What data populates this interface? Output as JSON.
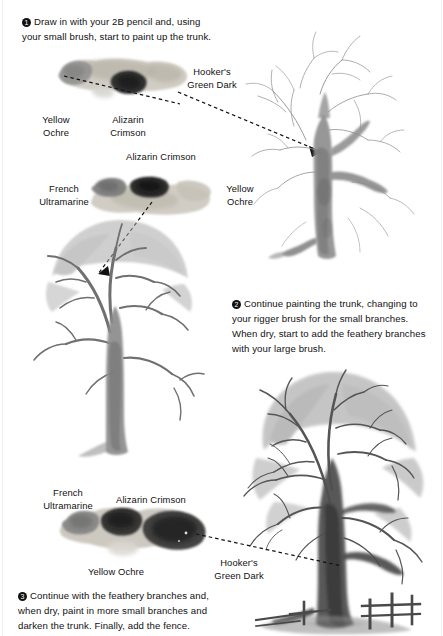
{
  "page": {
    "background": "#ffffff",
    "width": 443,
    "height": 636
  },
  "steps": [
    {
      "number": "❶",
      "number_plain": "1",
      "text": "Draw in with your 2B pencil and, using your small brush, start to paint up the trunk."
    },
    {
      "number": "❷",
      "number_plain": "2",
      "text": "Continue painting the trunk, changing to your rigger brush for the small branches. When dry, start to add the feathery branches with your large brush."
    },
    {
      "number": "❸",
      "number_plain": "3",
      "text": "Continue with the feathery branches and, when dry, paint in more small branches and darken the trunk. Finally, add the fence."
    }
  ],
  "pigment_labels": {
    "hookers_green_dark_top": "Hooker's\nGreen Dark",
    "yellow_ochre_top": "Yellow\nOchre",
    "alizarin_crimson_top": "Alizarin\nCrimson",
    "alizarin_crimson_mid": "Alizarin Crimson",
    "french_ultramarine_mid": "French\nUltramarine",
    "yellow_ochre_mid": "Yellow\nOchre",
    "french_ultramarine_bottom": "French\nUltramarine",
    "alizarin_crimson_bottom": "Alizarin Crimson",
    "yellow_ochre_bottom": "Yellow Ochre",
    "hookers_green_dark_bottom": "Hooker's\nGreen Dark"
  },
  "colors": {
    "ink": "#111111",
    "paper": "#ffffff",
    "wash_light": "#c9c9c9",
    "wash_mid": "#9a9a9a",
    "wash_dark": "#5e5e5e",
    "wash_darkest": "#2c2c2c",
    "pigment_yellow_ochre": "#bdb9ad",
    "pigment_alizarin_crimson": "#2f2f2f",
    "pigment_french_ultramarine": "#7d7d7d",
    "pigment_hookers_green_dark": "#4a4a4a"
  },
  "artworks": {
    "tree_step1": "pencil-sketch-tree-with-partly-painted-trunk",
    "tree_step2": "tree-with-painted-trunk-and-feathery-branches",
    "tree_step3": "finished-tree-with-fence-and-cast-shadow"
  }
}
